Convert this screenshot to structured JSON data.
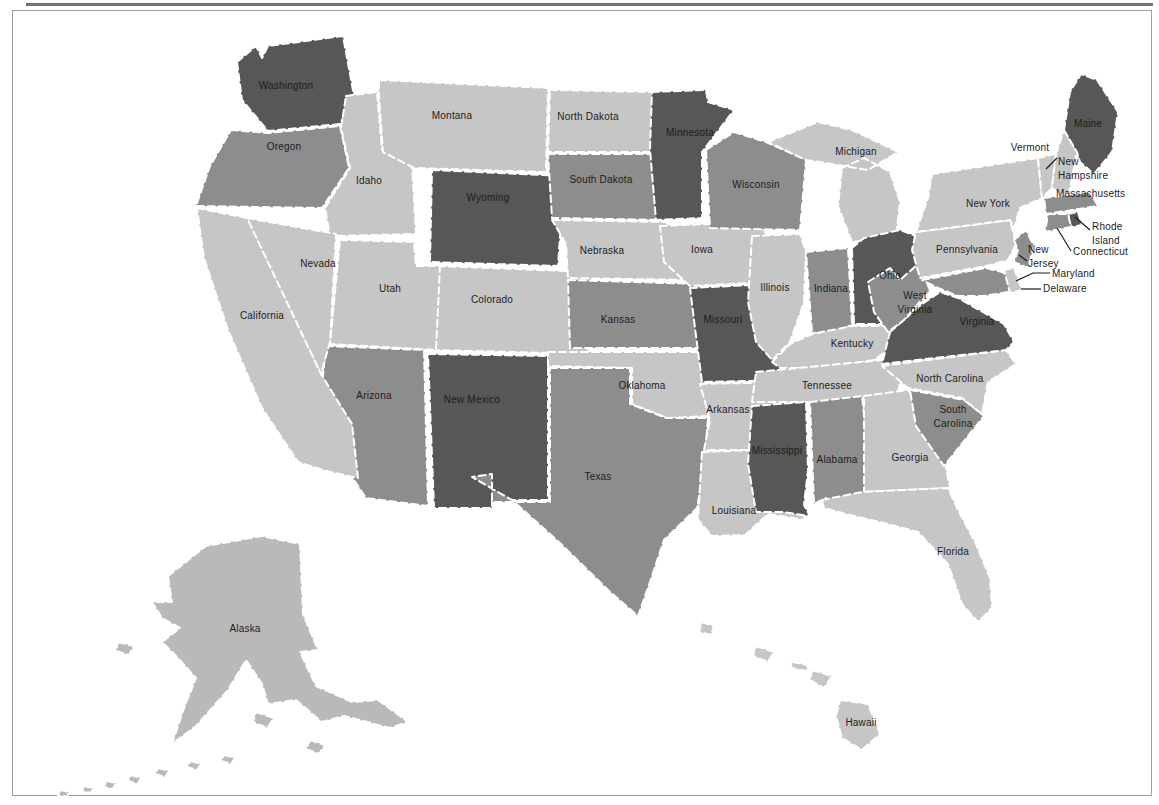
{
  "page": {
    "background": "#ffffff",
    "frame_color": "#9e9e9e",
    "top_rule_color": "#5a5a5a"
  },
  "map": {
    "type": "choropleth-us-states",
    "palette": {
      "dark": "#575757",
      "medium": "#8d8d8d",
      "light": "#c6c6c6",
      "alaska": "#b9b9b9",
      "state_border": "#ffffff",
      "label_color": "#1c1c1c",
      "water": "#ffffff"
    },
    "states": [
      {
        "id": "washington",
        "name": "Washington",
        "shade": "dark",
        "d": "M237,62 L256,46 L262,58 L268,46 L343,36 L354,96 L340,124 L268,131 L242,100 Z",
        "label": {
          "x": 286,
          "y": 89,
          "anchor": "middle",
          "lines": [
            "Washington"
          ]
        }
      },
      {
        "id": "oregon",
        "name": "Oregon",
        "shade": "medium",
        "d": "M231,130 L268,133 L340,126 L349,168 L322,208 L196,206 L210,166 Z",
        "label": {
          "x": 284,
          "y": 150,
          "anchor": "middle",
          "lines": [
            "Oregon"
          ]
        }
      },
      {
        "id": "idaho",
        "name": "Idaho",
        "shade": "light",
        "d": "M346,96 L377,92 L382,150 L412,164 L416,234 L330,236 L325,208 L350,168 L341,128 Z",
        "label": {
          "x": 369,
          "y": 184,
          "anchor": "middle",
          "lines": [
            "Idaho"
          ]
        }
      },
      {
        "id": "montana",
        "name": "Montana",
        "shade": "light",
        "d": "M379,80 L548,88 L546,172 L414,168 L383,152 L379,96 Z",
        "label": {
          "x": 452,
          "y": 119,
          "anchor": "middle",
          "lines": [
            "Montana"
          ]
        }
      },
      {
        "id": "wyoming",
        "name": "Wyoming",
        "shade": "dark",
        "d": "M432,170 L564,176 L558,266 L430,262 Z",
        "label": {
          "x": 488,
          "y": 201,
          "anchor": "middle",
          "lines": [
            "Wyoming"
          ]
        }
      },
      {
        "id": "colorado",
        "name": "Colorado",
        "shade": "light",
        "d": "M438,266 L592,272 L588,354 L434,350 Z",
        "label": {
          "x": 492,
          "y": 303,
          "anchor": "middle",
          "lines": [
            "Colorado"
          ]
        }
      },
      {
        "id": "new-mexico",
        "name": "New Mexico",
        "shade": "dark",
        "d": "M428,354 L548,356 L548,500 L492,500 L492,508 L434,508 Z",
        "label": {
          "x": 472,
          "y": 403,
          "anchor": "middle",
          "lines": [
            "New Mexico"
          ]
        }
      },
      {
        "id": "arizona",
        "name": "Arizona",
        "shade": "medium",
        "d": "M326,346 L424,350 L428,506 L366,498 L318,426 Z",
        "label": {
          "x": 374,
          "y": 399,
          "anchor": "middle",
          "lines": [
            "Arizona"
          ]
        }
      },
      {
        "id": "utah",
        "name": "Utah",
        "shade": "light",
        "d": "M340,240 L414,242 L416,266 L440,266 L436,350 L330,344 Z",
        "label": {
          "x": 390,
          "y": 292,
          "anchor": "middle",
          "lines": [
            "Utah"
          ]
        }
      },
      {
        "id": "nevada",
        "name": "Nevada",
        "shade": "light",
        "d": "M247,218 L336,234 L330,342 L321,374 L250,230 Z",
        "label": {
          "x": 318,
          "y": 267,
          "anchor": "middle",
          "lines": [
            "Nevada"
          ]
        }
      },
      {
        "id": "california",
        "name": "California",
        "shade": "light",
        "d": "M197,208 L247,218 L321,374 L352,424 L358,478 L330,472 L298,462 L262,408 L228,330 L204,258 Z",
        "label": {
          "x": 262,
          "y": 319,
          "anchor": "middle",
          "lines": [
            "California"
          ]
        }
      },
      {
        "id": "north-dakota",
        "name": "North Dakota",
        "shade": "light",
        "d": "M550,90 L656,92 L660,152 L548,152 Z",
        "label": {
          "x": 588,
          "y": 120,
          "anchor": "middle",
          "lines": [
            "North Dakota"
          ]
        }
      },
      {
        "id": "south-dakota",
        "name": "South Dakota",
        "shade": "medium",
        "d": "M548,154 L660,154 L666,220 L552,218 Z",
        "label": {
          "x": 601,
          "y": 183,
          "anchor": "middle",
          "lines": [
            "South Dakota"
          ]
        }
      },
      {
        "id": "nebraska",
        "name": "Nebraska",
        "shade": "light",
        "d": "M552,220 L666,222 L700,252 L698,280 L568,278 L566,244 Z",
        "label": {
          "x": 602,
          "y": 254,
          "anchor": "middle",
          "lines": [
            "Nebraska"
          ]
        }
      },
      {
        "id": "kansas",
        "name": "Kansas",
        "shade": "medium",
        "d": "M568,280 L700,284 L704,348 L570,348 Z",
        "label": {
          "x": 618,
          "y": 323,
          "anchor": "middle",
          "lines": [
            "Kansas"
          ]
        }
      },
      {
        "id": "oklahoma",
        "name": "Oklahoma",
        "shade": "light",
        "d": "M548,352 L704,352 L708,416 L668,418 L632,404 L632,368 L548,366 Z",
        "label": {
          "x": 642,
          "y": 389,
          "anchor": "middle",
          "lines": [
            "Oklahoma"
          ]
        }
      },
      {
        "id": "texas",
        "name": "Texas",
        "shade": "medium",
        "d": "M550,368 L630,368 L630,404 L666,418 L708,418 L704,468 L697,508 L664,540 L650,582 L638,616 L608,590 L560,543 L512,500 L472,477 L492,474 L492,502 L550,502 Z",
        "label": {
          "x": 598,
          "y": 480,
          "anchor": "middle",
          "lines": [
            "Texas"
          ]
        }
      },
      {
        "id": "minnesota",
        "name": "Minnesota",
        "shade": "dark",
        "d": "M652,92 L706,90 L708,102 L734,110 L702,152 L702,218 L656,220 L650,150 Z",
        "label": {
          "x": 690,
          "y": 136,
          "anchor": "middle",
          "lines": [
            "Minnesota"
          ]
        }
      },
      {
        "id": "iowa",
        "name": "Iowa",
        "shade": "light",
        "d": "M660,226 L756,222 L772,240 L770,282 L690,286 L664,262 Z",
        "label": {
          "x": 702,
          "y": 253,
          "anchor": "middle",
          "lines": [
            "Iowa"
          ]
        }
      },
      {
        "id": "missouri",
        "name": "Missouri",
        "shade": "dark",
        "d": "M690,288 L772,284 L782,312 L780,332 L792,368 L794,380 L702,382 L696,336 Z",
        "label": {
          "x": 723,
          "y": 323,
          "anchor": "middle",
          "lines": [
            "Missouri"
          ]
        }
      },
      {
        "id": "arkansas",
        "name": "Arkansas",
        "shade": "light",
        "d": "M700,384 L792,382 L786,450 L704,450 L710,420 Z",
        "label": {
          "x": 728,
          "y": 413,
          "anchor": "middle",
          "lines": [
            "Arkansas"
          ]
        }
      },
      {
        "id": "louisiana",
        "name": "Louisiana",
        "shade": "light",
        "d": "M702,452 L757,450 L754,476 L790,478 L786,498 L806,520 L768,514 L745,535 L712,536 L698,520 Z",
        "label": {
          "x": 734,
          "y": 514,
          "anchor": "middle",
          "lines": [
            "Louisiana"
          ]
        }
      },
      {
        "id": "wisconsin",
        "name": "Wisconsin",
        "shade": "medium",
        "d": "M706,150 L734,132 L766,142 L806,160 L800,230 L710,228 Z",
        "label": {
          "x": 756,
          "y": 188,
          "anchor": "middle",
          "lines": [
            "Wisconsin"
          ]
        }
      },
      {
        "id": "michigan",
        "name": "Michigan",
        "shade": "light",
        "d": "M768,142 L818,122 L852,130 L898,152 L868,170 L820,162 L806,160 Z M842,168 L864,158 L890,172 L900,202 L896,236 L852,242 L838,206 Z",
        "label": {
          "x": 856,
          "y": 155,
          "anchor": "middle",
          "lines": [
            "Michigan"
          ]
        }
      },
      {
        "id": "illinois",
        "name": "Illinois",
        "shade": "light",
        "d": "M752,236 L800,234 L806,252 L804,302 L790,342 L772,360 L756,342 L748,302 Z",
        "label": {
          "x": 775,
          "y": 291,
          "anchor": "middle",
          "lines": [
            "Illinois"
          ]
        }
      },
      {
        "id": "indiana",
        "name": "Indiana",
        "shade": "medium",
        "d": "M806,252 L848,248 L852,324 L832,338 L812,332 Z",
        "label": {
          "x": 831,
          "y": 292,
          "anchor": "middle",
          "lines": [
            "Indiana"
          ]
        }
      },
      {
        "id": "ohio",
        "name": "Ohio",
        "shade": "dark",
        "d": "M852,248 L864,238 L900,230 L926,240 L922,302 L898,324 L854,324 Z",
        "label": {
          "x": 890,
          "y": 279,
          "anchor": "middle",
          "lines": [
            "Ohio"
          ]
        }
      },
      {
        "id": "kentucky",
        "name": "Kentucky",
        "shade": "light",
        "d": "M772,362 L790,344 L812,334 L852,326 L898,326 L904,338 L874,360 L822,368 L780,368 Z",
        "label": {
          "x": 852,
          "y": 347,
          "anchor": "middle",
          "lines": [
            "Kentucky"
          ]
        }
      },
      {
        "id": "tennessee",
        "name": "Tennessee",
        "shade": "light",
        "d": "M756,372 L904,358 L898,394 L820,402 L752,402 Z",
        "label": {
          "x": 827,
          "y": 389,
          "anchor": "middle",
          "lines": [
            "Tennessee"
          ]
        }
      },
      {
        "id": "mississippi",
        "name": "Mississippi",
        "shade": "dark",
        "d": "M752,406 L806,402 L808,470 L804,505 L810,516 L782,512 L756,512 L748,464 Z",
        "label": {
          "x": 777,
          "y": 454,
          "anchor": "middle",
          "lines": [
            "Mississippi"
          ]
        }
      },
      {
        "id": "alabama",
        "name": "Alabama",
        "shade": "medium",
        "d": "M810,402 L862,396 L872,492 L837,510 L826,498 L814,504 Z",
        "label": {
          "x": 837,
          "y": 463,
          "anchor": "middle",
          "lines": [
            "Alabama"
          ]
        }
      },
      {
        "id": "georgia",
        "name": "Georgia",
        "shade": "light",
        "d": "M864,396 L908,390 L950,440 L946,468 L950,488 L864,492 Z",
        "label": {
          "x": 910,
          "y": 461,
          "anchor": "middle",
          "lines": [
            "Georgia"
          ]
        }
      },
      {
        "id": "south-carolina",
        "name": "South Carolina",
        "shade": "medium",
        "d": "M910,390 L964,400 L984,416 L944,466 L916,426 Z",
        "label": {
          "x": 953,
          "y": 413,
          "anchor": "middle",
          "lines": [
            "South",
            "Carolina"
          ]
        }
      },
      {
        "id": "north-carolina",
        "name": "North Carolina",
        "shade": "light",
        "d": "M882,366 L1006,350 L1016,364 L988,382 L982,414 L962,398 L908,388 Z",
        "label": {
          "x": 950,
          "y": 382,
          "anchor": "middle",
          "lines": [
            "North Carolina"
          ]
        }
      },
      {
        "id": "virginia",
        "name": "Virginia",
        "shade": "dark",
        "d": "M890,332 L922,304 L940,292 L958,298 L1004,324 L1014,342 L1006,350 L882,364 Z",
        "label": {
          "x": 977,
          "y": 325,
          "anchor": "middle",
          "lines": [
            "Virginia"
          ]
        }
      },
      {
        "id": "west-virginia",
        "name": "West Virginia",
        "shade": "medium",
        "d": "M868,282 L890,268 L900,280 L918,264 L930,290 L904,320 L888,332 L874,312 Z",
        "label": {
          "x": 915,
          "y": 299,
          "anchor": "middle",
          "lines": [
            "West",
            "Virginia"
          ]
        }
      },
      {
        "id": "maryland",
        "name": "Maryland",
        "shade": "medium",
        "d": "M922,280 L986,268 L1002,272 L1014,280 L1008,292 L984,296 L958,296 L938,288 Z",
        "label": {
          "x": 1052,
          "y": 277,
          "anchor": "start",
          "lines": [
            "Maryland"
          ]
        }
      },
      {
        "id": "delaware",
        "name": "Delaware",
        "shade": "light",
        "d": "M1004,270 L1014,268 L1022,290 L1010,293 Z",
        "label": {
          "x": 1043,
          "y": 292,
          "anchor": "start",
          "lines": [
            "Delaware"
          ]
        }
      },
      {
        "id": "pennsylvania",
        "name": "Pennsylvania",
        "shade": "light",
        "d": "M916,232 L1010,220 L1016,244 L1008,260 L986,266 L920,278 L912,250 Z",
        "label": {
          "x": 967,
          "y": 253,
          "anchor": "middle",
          "lines": [
            "Pennsylvania"
          ]
        }
      },
      {
        "id": "new-york",
        "name": "New York",
        "shade": "light",
        "d": "M932,174 L1038,158 L1042,198 L1020,208 L1014,228 L1010,220 L916,232 L928,198 Z",
        "label": {
          "x": 988,
          "y": 207,
          "anchor": "middle",
          "lines": [
            "New York"
          ]
        }
      },
      {
        "id": "new-jersey",
        "name": "New Jersey",
        "shade": "medium",
        "d": "M1014,240 L1026,230 L1034,246 L1028,268 L1014,262 L1018,250 Z",
        "label": {
          "x": 1028,
          "y": 253,
          "anchor": "start",
          "lines": [
            "New",
            "Jersey"
          ]
        }
      },
      {
        "id": "vermont",
        "name": "Vermont",
        "shade": "light",
        "d": "M1038,158 L1056,154 L1052,188 L1042,198 Z",
        "label": {
          "x": 1030,
          "y": 151,
          "anchor": "middle",
          "lines": [
            "Vermont"
          ]
        }
      },
      {
        "id": "new-hampshire",
        "name": "New Hampshire",
        "shade": "light",
        "d": "M1056,154 L1064,130 L1077,152 L1068,198 L1052,188 Z",
        "label": {
          "x": 1058,
          "y": 165,
          "anchor": "start",
          "lines": [
            "New",
            "Hampshire"
          ]
        }
      },
      {
        "id": "maine",
        "name": "Maine",
        "shade": "dark",
        "d": "M1064,130 L1070,92 L1081,74 L1097,80 L1118,112 L1112,152 L1094,174 L1080,162 L1077,152 Z",
        "label": {
          "x": 1088,
          "y": 127,
          "anchor": "middle",
          "lines": [
            "Maine"
          ]
        }
      },
      {
        "id": "massachusetts",
        "name": "Massachusetts",
        "shade": "medium",
        "d": "M1044,198 L1090,192 L1098,206 L1046,214 Z",
        "label": {
          "x": 1056,
          "y": 197,
          "anchor": "start",
          "lines": [
            "Massachusetts"
          ]
        }
      },
      {
        "id": "rhode-island",
        "name": "Rhode Island",
        "shade": "dark",
        "d": "M1068,214 L1078,212 L1082,225 L1071,227 Z",
        "label": {
          "x": 1092,
          "y": 230,
          "anchor": "start",
          "lines": [
            "Rhode",
            "Island"
          ]
        }
      },
      {
        "id": "connecticut",
        "name": "Connecticut",
        "shade": "medium",
        "d": "M1048,214 L1068,214 L1071,227 L1045,232 Z",
        "label": {
          "x": 1073,
          "y": 255,
          "anchor": "start",
          "lines": [
            "Connecticut"
          ]
        }
      },
      {
        "id": "florida",
        "name": "Florida",
        "shade": "light",
        "d": "M822,500 L862,492 L948,488 L958,510 L976,544 L990,578 L992,608 L978,622 L962,604 L948,564 L918,532 L880,522 L846,514 L824,508 Z",
        "label": {
          "x": 953,
          "y": 555,
          "anchor": "middle",
          "lines": [
            "Florida"
          ]
        }
      },
      {
        "id": "alaska",
        "name": "Alaska",
        "shade": "alaska",
        "d": "M168,576 L206,546 L262,536 L300,544 L303,614 L318,650 L300,652 L316,686 L352,702 L378,700 L408,722 L390,728 L344,716 L322,722 L296,700 L268,704 L262,684 L246,660 L228,690 L196,726 L172,744 L184,708 L196,678 L178,658 L162,642 L180,628 L162,618 L152,602 L172,602 Z M118,642 l16,4 -5,9 -13,-4 Z M256,712 l18,6 -7,10 -14,-6 Z M310,740 l15,5 -6,9 -13,-5 Z M60,790 l9,2 -2,5 -9,-2 Z M84,786 l9,2 -2,5 -9,-2 Z M107,781 l9,2 -3,6 -9,-2 Z M131,775 l10,3 -3,6 -10,-3 Z M158,768 l11,3 -4,6 -10,-3 Z M191,761 l10,3 -4,6 -10,-3 Z M224,755 l11,3 -4,6 -10,-3 Z",
        "label": {
          "x": 245,
          "y": 632,
          "anchor": "middle",
          "lines": [
            "Alaska"
          ]
        }
      },
      {
        "id": "hawaii",
        "name": "Hawaii",
        "shade": "light",
        "d": "M702,622 l12,4 -3,9 -12,-3 Z M756,646 l18,6 -6,10 -15,-6 Z M792,662 l16,3 -2,6 -15,-3 Z M812,670 l20,6 -8,12 -14,-8 Z M840,700 L868,704 L880,734 L862,750 L842,738 L836,716 Z",
        "label": {
          "x": 861,
          "y": 726,
          "anchor": "middle",
          "lines": [
            "Hawaii"
          ]
        }
      }
    ],
    "leader_lines": [
      {
        "for": "new-hampshire",
        "points": [
          [
            1046,
            169
          ],
          [
            1057,
            158
          ]
        ]
      },
      {
        "for": "rhode-island",
        "points": [
          [
            1075,
            217
          ],
          [
            1090,
            230
          ]
        ]
      },
      {
        "for": "connecticut",
        "points": [
          [
            1057,
            228
          ],
          [
            1071,
            251
          ]
        ]
      },
      {
        "for": "new-jersey",
        "points": [
          [
            1019,
            255
          ],
          [
            1027,
            261
          ]
        ]
      },
      {
        "for": "maryland",
        "points": [
          [
            1016,
            281
          ],
          [
            1033,
            273
          ],
          [
            1050,
            273
          ]
        ]
      },
      {
        "for": "delaware",
        "points": [
          [
            1021,
            289
          ],
          [
            1041,
            289
          ]
        ]
      }
    ]
  }
}
